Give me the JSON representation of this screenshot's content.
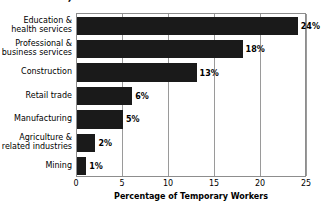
{
  "chart_data": {
    "type": "bar",
    "orientation": "horizontal",
    "title": "Industries, 2005",
    "xlabel": "Percentage of Temporary Workers",
    "ylabel": "",
    "categories": [
      "Education &\nhealth services",
      "Professional &\nbusiness services",
      "Construction",
      "Retail trade",
      "Manufacturing",
      "Agriculture &\nrelated industries",
      "Mining"
    ],
    "values": [
      24,
      18,
      13,
      6,
      5,
      2,
      1
    ],
    "data_labels": [
      "24%",
      "18%",
      "13%",
      "6%",
      "5%",
      "2%",
      "1%"
    ],
    "xlim": [
      0,
      25
    ],
    "xticks": [
      0,
      5,
      10,
      15,
      20,
      25
    ],
    "xtick_labels": [
      "0",
      "5",
      "10",
      "15",
      "20",
      "25"
    ],
    "grid": "vertical",
    "legend": "none",
    "bar_color": "#1a1a1a",
    "background_color": "#ffffff",
    "gridline_color": "#9a9a9a"
  }
}
